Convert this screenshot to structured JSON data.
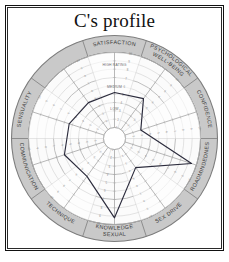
{
  "page": {
    "title": "C's profile"
  },
  "chart_data": {
    "type": "radar",
    "title": "C's profile",
    "center": {
      "x": 105.5,
      "y": 105.5
    },
    "radii": {
      "hub": 11,
      "inner_plot": 86,
      "ring_inner": 86,
      "ring_outer": 103
    },
    "scale": {
      "min": 1,
      "max": 10,
      "tick_labels": [
        "10",
        "9",
        "8",
        "7",
        "6",
        "5",
        "4",
        "3",
        "2",
        "1"
      ],
      "band_labels": [
        "HIGH RATING",
        "MEDIUM",
        "LOW"
      ],
      "band_label_radii": [
        74,
        52,
        30
      ]
    },
    "axis_colors": {
      "ring_fill": "#c9c9c9",
      "ring_stroke": "#7d7d7d",
      "plot_fill": "#fbfbfb",
      "grid_stroke": "#c2c2c2",
      "spoke_stroke": "#9a9a9a",
      "data_stroke": "#2b2b3c",
      "tick_text": "#8d8d8d",
      "label_text": "#3a3a3a"
    },
    "categories": [
      {
        "label": "SATISFACTION",
        "angle": -90,
        "value": 5.2,
        "two_line": false
      },
      {
        "label": "PSYCHOLOGICAL WELL-BEING",
        "angle": -54,
        "value": 5.6,
        "two_line": true
      },
      {
        "label": "CONFIDENCE",
        "angle": -18,
        "value": 3.0,
        "two_line": false
      },
      {
        "label": "BROADMINDEDNESS",
        "angle": 18,
        "value": 9.4,
        "two_line": false
      },
      {
        "label": "SEX DRIVE",
        "angle": 54,
        "value": 4.0,
        "two_line": false
      },
      {
        "label": "SEXUAL KNOWLEDGE",
        "angle": 90,
        "value": 9.2,
        "two_line": true
      },
      {
        "label": "TECHNIQUE",
        "angle": 126,
        "value": 5.3,
        "two_line": false
      },
      {
        "label": "COMMUNICATION",
        "angle": 162,
        "value": 6.0,
        "two_line": false
      },
      {
        "label": "SENSUALITY",
        "angle": 198,
        "value": 5.4,
        "two_line": false
      },
      {
        "label": "SATISFACTION_PAD",
        "angle": 234,
        "value": 5.0,
        "two_line": false
      }
    ],
    "values": [
      5.2,
      5.6,
      3.0,
      9.4,
      4.0,
      9.2,
      5.3,
      6.0,
      5.4,
      5.0
    ],
    "grid": true,
    "legend": "none"
  }
}
